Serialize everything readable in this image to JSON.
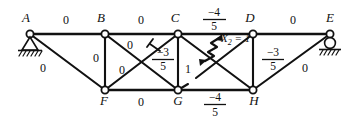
{
  "figure": {
    "type": "truss-diagram",
    "line_color": "#111111",
    "background_color": "#ffffff"
  },
  "joints": [
    {
      "id": "A",
      "label": "A",
      "x": 30,
      "y": 34,
      "support": "pin"
    },
    {
      "id": "B",
      "label": "B",
      "x": 105,
      "y": 34,
      "support": "none"
    },
    {
      "id": "C",
      "label": "C",
      "x": 178,
      "y": 34,
      "support": "none"
    },
    {
      "id": "D",
      "label": "D",
      "x": 253,
      "y": 34,
      "support": "none"
    },
    {
      "id": "E",
      "label": "E",
      "x": 330,
      "y": 34,
      "support": "roller"
    },
    {
      "id": "F",
      "label": "F",
      "x": 105,
      "y": 90,
      "support": "none"
    },
    {
      "id": "G",
      "label": "G",
      "x": 178,
      "y": 90,
      "support": "none"
    },
    {
      "id": "H",
      "label": "H",
      "x": 253,
      "y": 90,
      "support": "none"
    }
  ],
  "members": [
    {
      "id": "AB",
      "from": "A",
      "to": "B",
      "kind": "chord"
    },
    {
      "id": "BC",
      "from": "B",
      "to": "C",
      "kind": "chord"
    },
    {
      "id": "CD",
      "from": "C",
      "to": "D",
      "kind": "chord"
    },
    {
      "id": "DE",
      "from": "D",
      "to": "E",
      "kind": "chord"
    },
    {
      "id": "FG",
      "from": "F",
      "to": "G",
      "kind": "chord"
    },
    {
      "id": "GH",
      "from": "G",
      "to": "H",
      "kind": "chord"
    },
    {
      "id": "AF",
      "from": "A",
      "to": "F",
      "kind": "diagonal"
    },
    {
      "id": "BF",
      "from": "B",
      "to": "F",
      "kind": "vertical"
    },
    {
      "id": "BG",
      "from": "B",
      "to": "G",
      "kind": "diagonal"
    },
    {
      "id": "CF",
      "from": "C",
      "to": "F",
      "kind": "diagonal"
    },
    {
      "id": "CG",
      "from": "C",
      "to": "G",
      "kind": "vertical"
    },
    {
      "id": "CH",
      "from": "C",
      "to": "H",
      "kind": "diagonal"
    },
    {
      "id": "DG",
      "from": "D",
      "to": "G",
      "kind": "diagonal"
    },
    {
      "id": "DH",
      "from": "D",
      "to": "H",
      "kind": "vertical"
    },
    {
      "id": "HE",
      "from": "H",
      "to": "E",
      "kind": "diagonal"
    }
  ],
  "member_forces": [
    {
      "member": "AB",
      "text": "0",
      "fraction": false,
      "x": 66,
      "y": 22
    },
    {
      "member": "BC",
      "text": "0",
      "fraction": false,
      "x": 141,
      "y": 22
    },
    {
      "member": "CD",
      "numerator": "−4",
      "denominator": "5",
      "fraction": true,
      "x": 213,
      "y": 17
    },
    {
      "member": "DE",
      "text": "0",
      "fraction": false,
      "x": 293,
      "y": 22
    },
    {
      "member": "AF",
      "text": "0",
      "fraction": false,
      "x": 43,
      "y": 70
    },
    {
      "member": "BF",
      "text": "0",
      "fraction": false,
      "x": 96,
      "y": 60
    },
    {
      "member": "BG",
      "text": "0",
      "fraction": false,
      "x": 128,
      "y": 49
    },
    {
      "member": "CF",
      "text": "0",
      "fraction": false,
      "x": 122,
      "y": 72
    },
    {
      "member": "BG_cut",
      "numerator": "−3",
      "denominator": "5",
      "fraction": true,
      "x": 160,
      "y": 58
    },
    {
      "member": "CG",
      "text": "1",
      "fraction": false,
      "x": 187,
      "y": 71
    },
    {
      "member": "DH",
      "numerator": "−3",
      "denominator": "5",
      "fraction": true,
      "x": 271,
      "y": 58
    },
    {
      "member": "HE",
      "text": "0",
      "fraction": false,
      "x": 304,
      "y": 70
    },
    {
      "member": "FG",
      "text": "0",
      "fraction": false,
      "x": 141,
      "y": 104
    },
    {
      "member": "GH",
      "numerator": "−4",
      "denominator": "5",
      "fraction": true,
      "x": 214,
      "y": 100
    }
  ],
  "redundant": {
    "label_prefix": "X",
    "label_subscript": "2",
    "label_suffix": " = 1",
    "full_text": "X2 = 1",
    "member": "DG",
    "cut_x": 208,
    "cut_y": 50,
    "label_x": 219,
    "label_y": 44
  },
  "cut_marks": [
    {
      "on_member": "BG",
      "x": 156,
      "y": 45,
      "style": "perpendicular-tick"
    }
  ],
  "supports": {
    "A": {
      "type": "pin",
      "label": "pinned-support"
    },
    "E": {
      "type": "roller",
      "label": "roller-support"
    }
  }
}
